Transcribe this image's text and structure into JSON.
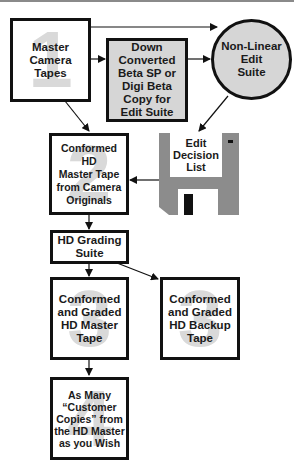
{
  "diagram": {
    "nodes": {
      "master_camera_tapes": {
        "step": "1",
        "label": "Master\nCamera\nTapes"
      },
      "down_converted": {
        "label": "Down\nConverted\nBeta SP or\nDigi Beta\nCopy for\nEdit Suite"
      },
      "non_linear_edit": {
        "label": "Non-Linear\nEdit\nSuite"
      },
      "edl": {
        "label": "Edit\nDecision\nList"
      },
      "conformed_hd_master": {
        "step": "2",
        "label": "Conformed HD\nMaster Tape\nfrom Camera\nOriginals"
      },
      "hd_grading": {
        "label": "HD Grading\nSuite"
      },
      "graded_master": {
        "step": "3",
        "label": "Conformed\nand Graded\nHD Master\nTape"
      },
      "graded_backup": {
        "step": "3",
        "label": "Conformed\nand Graded\nHD Backup\nTape"
      },
      "customer_copies": {
        "step": "4",
        "label": "As Many\n“Customer\nCopies” from\nthe HD Master\nas you Wish"
      }
    },
    "edges": [
      {
        "from": "master_camera_tapes",
        "to": "non_linear_edit"
      },
      {
        "from": "master_camera_tapes",
        "to": "down_converted"
      },
      {
        "from": "down_converted",
        "to": "non_linear_edit"
      },
      {
        "from": "master_camera_tapes",
        "to": "conformed_hd_master"
      },
      {
        "from": "non_linear_edit",
        "to": "edl"
      },
      {
        "from": "edl",
        "to": "conformed_hd_master"
      },
      {
        "from": "conformed_hd_master",
        "to": "hd_grading"
      },
      {
        "from": "hd_grading",
        "to": "graded_master"
      },
      {
        "from": "hd_grading",
        "to": "graded_backup"
      },
      {
        "from": "graded_master",
        "to": "customer_copies"
      }
    ],
    "colors": {
      "line": "#111111",
      "fill_grey": "#d6d6d6",
      "step_number": "#d9d9d9",
      "floppy": "#8c8c8c"
    }
  }
}
